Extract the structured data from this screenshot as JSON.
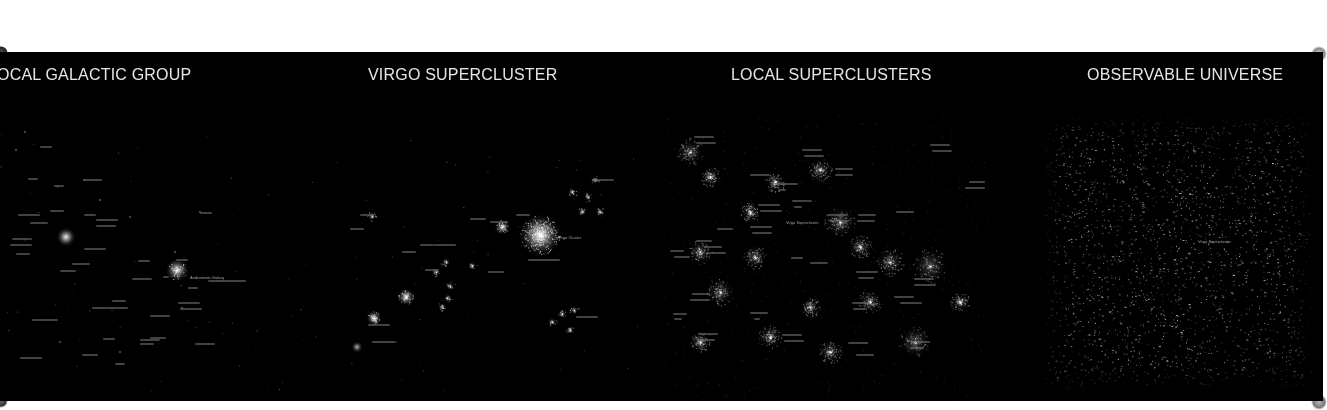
{
  "panels": [
    {
      "id": "local-galactic-group",
      "title": "OCAL GALACTIC GROUP",
      "locator_label": "Andromeda Galaxy"
    },
    {
      "id": "virgo-supercluster",
      "title": "VIRGO SUPERCLUSTER",
      "locator_label": "Virgo Cluster"
    },
    {
      "id": "local-superclusters",
      "title": "LOCAL SUPERCLUSTERS",
      "locator_label": "Virgo Supercluster"
    },
    {
      "id": "observable-universe",
      "title": "OBSERVABLE UNIVERSE",
      "locator_label": "Virgo Supercluster"
    }
  ],
  "colors": {
    "background": "#000000",
    "page": "#ffffff",
    "title_text": "#e6e6e6",
    "label_text": "#bdbdbd"
  }
}
